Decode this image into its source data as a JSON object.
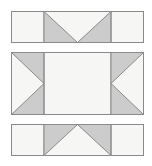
{
  "figure": {
    "type": "geometric-net-diagram",
    "title": "",
    "background_color": "#ffffff",
    "canvas": {
      "width": 152,
      "height": 166
    },
    "palette": {
      "light_fill": "#f6f6f4",
      "shaded_fill": "#cccccc",
      "stroke": "#8a8a8a",
      "stroke_light": "#9e9e9e",
      "stroke_width": 1
    },
    "panels": [
      {
        "id": "top-panel",
        "name": "top-strip",
        "x": 11,
        "y": 11,
        "width": 133,
        "height": 32,
        "dividers_x": [
          44,
          111
        ],
        "sections": [
          {
            "id": "top-left-flap",
            "name": "left-flap",
            "fill": "light",
            "shape": "rectangle"
          },
          {
            "id": "top-center-flap",
            "name": "center-flap",
            "fill": "shaded",
            "shape": "v-notch-down",
            "notch": {
              "apex_x": 77.5,
              "apex_y": 43,
              "direction": "down"
            }
          },
          {
            "id": "top-right-flap",
            "name": "right-flap",
            "fill": "light",
            "shape": "rectangle"
          }
        ]
      },
      {
        "id": "middle-panel",
        "name": "middle-strip",
        "x": 11,
        "y": 52,
        "width": 133,
        "height": 63,
        "dividers_x": [
          44,
          111
        ],
        "sections": [
          {
            "id": "middle-left-flap",
            "name": "left-flap",
            "fill": "shaded",
            "shape": "triangle-right",
            "notch": {
              "apex_x": 44,
              "apex_y": 83.5,
              "direction": "right"
            }
          },
          {
            "id": "middle-center-face",
            "name": "center-face",
            "fill": "light",
            "shape": "rectangle"
          },
          {
            "id": "middle-right-flap",
            "name": "right-flap",
            "fill": "shaded",
            "shape": "triangle-left",
            "notch": {
              "apex_x": 111,
              "apex_y": 83.5,
              "direction": "left"
            }
          }
        ]
      },
      {
        "id": "bottom-panel",
        "name": "bottom-strip",
        "x": 11,
        "y": 124,
        "width": 133,
        "height": 32,
        "dividers_x": [
          44,
          111
        ],
        "sections": [
          {
            "id": "bottom-left-flap",
            "name": "left-flap",
            "fill": "light",
            "shape": "rectangle"
          },
          {
            "id": "bottom-center-flap",
            "name": "center-flap",
            "fill": "shaded",
            "shape": "triangle-up",
            "notch": {
              "apex_x": 77.5,
              "apex_y": 124,
              "direction": "up"
            }
          },
          {
            "id": "bottom-right-flap",
            "name": "right-flap",
            "fill": "light",
            "shape": "rectangle"
          }
        ]
      }
    ],
    "labels": []
  }
}
